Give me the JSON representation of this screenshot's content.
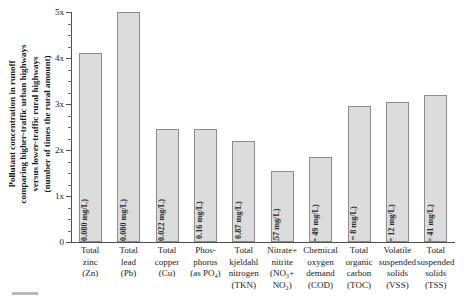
{
  "chart_data": {
    "type": "bar",
    "title": "",
    "xlabel": "",
    "ylabel": "Pollutant concentration in runoff comparing higher-traffic urban highways versus lower-traffic rural highways (number of times the rural amount)",
    "ylabel_lines": [
      "Pollutant concentration in runoff",
      "comparing higher-traffic urban highways",
      "versus lower-traffic rural highways",
      "(number of times the rural amount)"
    ],
    "ylim": [
      0,
      5
    ],
    "y_ticks": [
      "0",
      "1x",
      "2x",
      "3x",
      "4x",
      "5x"
    ],
    "y_tick_values": [
      0,
      1,
      2,
      3,
      4,
      5
    ],
    "y_minor_tick_step": 0.25,
    "grid": false,
    "legend": null,
    "categories": [
      "Total zinc (Zn)",
      "Total lead (Pb)",
      "Total copper (Cu)",
      "Phosphorus (as PO4)",
      "Total kjeldahl nitrogen (TKN)",
      "Nitrate+nitrite (NO3+NO2)",
      "Chemical oxygen demand (COD)",
      "Total organic carbon (TOC)",
      "Volatile suspended solids (VSS)",
      "Total suspended solids (TSS)"
    ],
    "values": [
      4.1,
      5.0,
      2.45,
      2.45,
      2.2,
      1.55,
      1.85,
      2.95,
      3.05,
      3.2
    ],
    "bar_labels": [
      "(Rural = 0.080 mg/L)",
      "(Rural = 0.080 mg/L)",
      "(Rural = 0.022 mg/L)",
      "(Rural = 0.16 mg/L)",
      "(Rural = 0.87 mg/L)",
      "(R = 0.57 mg/L)",
      "(Rural = 49 mg/L)",
      "(Rural = 8 mg/L)",
      "(Rural = 12 mg/L)",
      "(Rural = 41 mg/L)"
    ],
    "bar_fill_color": "#dcdcdc",
    "bar_border_color": "#8c8c8c",
    "axis_color": "#4d4d4d"
  },
  "x_label_lines": [
    [
      "Total",
      "zinc",
      "(Zn)"
    ],
    [
      "Total",
      "lead",
      "(Pb)"
    ],
    [
      "Total",
      "copper",
      "(Cu)"
    ],
    [
      "Phos-",
      "phorus",
      "(as PO₄)"
    ],
    [
      "Total",
      "kjeldahl",
      "nitrogen",
      "(TKN)"
    ],
    [
      "Nitrate+",
      "nitrite",
      "(NO₃+",
      "NO₂)"
    ],
    [
      "Chemical",
      "oxygen",
      "demand",
      "(COD)"
    ],
    [
      "Total",
      "organic",
      "carbon",
      "(TOC)"
    ],
    [
      "Volatile",
      "suspended",
      "solids",
      "(VSS)"
    ],
    [
      "Total",
      "suspended",
      "solids",
      "(TSS)"
    ]
  ]
}
